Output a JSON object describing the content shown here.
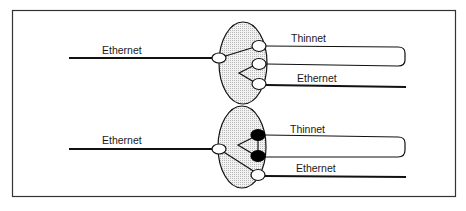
{
  "diagram": {
    "type": "network-switch-configuration",
    "frame": {
      "stroke": "#333333"
    },
    "colors": {
      "line": "#1a1a1a",
      "switch_fill": "#e6e6e6",
      "open_port": "#ffffff",
      "closed_port": "#000000"
    },
    "panels": [
      {
        "id": "top",
        "state": "ethernet-connected-via-thinnet-loop",
        "left_label": "Ethernet",
        "right_top_label": "Thinnet",
        "right_bottom_label": "Ethernet",
        "ports": [
          "open",
          "open",
          "open",
          "open"
        ]
      },
      {
        "id": "bottom",
        "state": "ethernet-direct-thinnet-bypassed",
        "left_label": "Ethernet",
        "right_top_label": "Thinnet",
        "right_bottom_label": "Ethernet",
        "ports": [
          "open",
          "closed",
          "closed",
          "open"
        ]
      }
    ]
  }
}
